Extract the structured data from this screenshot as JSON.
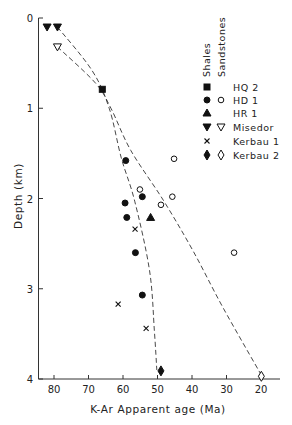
{
  "chart_data": {
    "type": "scatter",
    "title": "",
    "xlabel": "K-Ar Apparent age (Ma)",
    "ylabel": "Depth (km)",
    "xlim": [
      85,
      15
    ],
    "ylim": [
      0,
      4
    ],
    "x_reversed": true,
    "y_reversed": true,
    "x_ticks": [
      80,
      70,
      60,
      50,
      40,
      30,
      20
    ],
    "x_tick_labels": [
      "80",
      "70",
      "60",
      "50",
      "40",
      "30",
      "20"
    ],
    "y_ticks": [
      0,
      1,
      2,
      3,
      4
    ],
    "y_tick_labels": [
      "0",
      "1",
      "2",
      "3",
      "4"
    ],
    "grid": false,
    "legend": {
      "placement": "top-right",
      "column_headers": [
        "Shales",
        "Sandstones"
      ],
      "entries": [
        {
          "label": "HQ 2",
          "shale_marker": "filled-square",
          "sandstone_marker": null
        },
        {
          "label": "HD 1",
          "shale_marker": "filled-circle",
          "sandstone_marker": "open-circle"
        },
        {
          "label": "HR 1",
          "shale_marker": "filled-triangle-up",
          "sandstone_marker": null
        },
        {
          "label": "Misedor",
          "shale_marker": "filled-triangle-down",
          "sandstone_marker": "open-triangle-down"
        },
        {
          "label": "Kerbau 1",
          "shale_marker": "cross",
          "sandstone_marker": null
        },
        {
          "label": "Kerbau 2",
          "shale_marker": "filled-diamond",
          "sandstone_marker": "open-diamond"
        }
      ]
    },
    "series": [
      {
        "name": "HQ 2 (shales)",
        "marker": "filled-square",
        "points": [
          [
            66,
            0.79
          ]
        ]
      },
      {
        "name": "HD 1 (shales)",
        "marker": "filled-circle",
        "points": [
          [
            59.2,
            1.58
          ],
          [
            54.4,
            1.98
          ],
          [
            59.4,
            2.05
          ],
          [
            58.9,
            2.21
          ],
          [
            56.4,
            2.6
          ],
          [
            54.4,
            3.07
          ]
        ]
      },
      {
        "name": "HD 1 (sandstones)",
        "marker": "open-circle",
        "points": [
          [
            45.2,
            1.56
          ],
          [
            55.1,
            1.9
          ],
          [
            45.7,
            1.98
          ],
          [
            49.0,
            2.07
          ],
          [
            27.8,
            2.6
          ]
        ]
      },
      {
        "name": "HR 1 (shales)",
        "marker": "filled-triangle-up",
        "points": [
          [
            52.0,
            2.21
          ]
        ]
      },
      {
        "name": "Misedor (shales)",
        "marker": "filled-triangle-down",
        "points": [
          [
            82,
            0.1
          ],
          [
            79,
            0.1
          ]
        ]
      },
      {
        "name": "Misedor (sandstones)",
        "marker": "open-triangle-down",
        "points": [
          [
            79,
            0.32
          ]
        ]
      },
      {
        "name": "Kerbau 1 (shales)",
        "marker": "cross",
        "points": [
          [
            56.5,
            2.34
          ],
          [
            61.4,
            3.17
          ],
          [
            53.3,
            3.44
          ]
        ]
      },
      {
        "name": "Kerbau 2 (shales)",
        "marker": "filled-diamond",
        "points": [
          [
            49.0,
            3.91
          ]
        ]
      },
      {
        "name": "Kerbau 2 (sandstones)",
        "marker": "open-diamond",
        "points": [
          [
            19.9,
            3.97
          ]
        ]
      }
    ],
    "trend_lines": [
      {
        "name": "shale-trend",
        "style": "dashed",
        "points": [
          [
            79,
            0.1
          ],
          [
            69,
            0.58
          ],
          [
            64,
            1.0
          ],
          [
            60.5,
            1.55
          ],
          [
            56.6,
            2.03
          ],
          [
            52.3,
            2.8
          ],
          [
            50.9,
            3.47
          ],
          [
            50.2,
            3.9
          ]
        ]
      },
      {
        "name": "sandstone-trend",
        "style": "dashed",
        "points": [
          [
            79,
            0.32
          ],
          [
            68,
            0.72
          ],
          [
            63.5,
            1.0
          ],
          [
            57.7,
            1.47
          ],
          [
            48.3,
            2.02
          ],
          [
            39.7,
            2.58
          ],
          [
            31,
            3.21
          ],
          [
            19.7,
            3.97
          ]
        ]
      }
    ]
  }
}
